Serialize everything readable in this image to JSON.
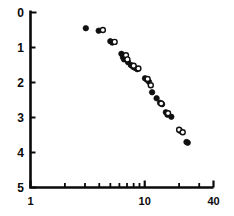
{
  "chart_data": {
    "type": "scatter",
    "title": "",
    "subtitle": "",
    "xlabel": "",
    "ylabel": "",
    "xscale": "log",
    "yscale": "linear",
    "xlim": [
      1,
      40
    ],
    "ylim": [
      5,
      0
    ],
    "y_inverted": true,
    "grid": false,
    "legend": "none",
    "x_tick_labels": [
      "1",
      "10",
      "40"
    ],
    "x_tick_values": [
      1,
      10,
      40
    ],
    "x_minor_ticks": [
      2,
      3,
      4,
      5,
      6,
      7,
      8,
      9,
      20,
      30
    ],
    "y_tick_labels": [
      "0",
      "1",
      "2",
      "3",
      "4",
      "5"
    ],
    "y_tick_values": [
      0,
      1,
      2,
      3,
      4,
      5
    ],
    "series": [
      {
        "name": "filled",
        "marker": "filled-circle",
        "color": "#101010",
        "points": [
          [
            3.05,
            0.45
          ],
          [
            3.95,
            0.52
          ],
          [
            5.0,
            0.82
          ],
          [
            5.2,
            0.86
          ],
          [
            6.25,
            1.18
          ],
          [
            6.45,
            1.28
          ],
          [
            6.6,
            1.34
          ],
          [
            7.15,
            1.42
          ],
          [
            7.55,
            1.5
          ],
          [
            7.9,
            1.55
          ],
          [
            8.2,
            1.58
          ],
          [
            8.6,
            1.62
          ],
          [
            10.05,
            1.88
          ],
          [
            10.45,
            1.92
          ],
          [
            10.9,
            1.98
          ],
          [
            11.6,
            2.28
          ],
          [
            12.7,
            2.45
          ],
          [
            13.6,
            2.58
          ],
          [
            14.2,
            2.62
          ],
          [
            15.3,
            2.85
          ],
          [
            15.8,
            2.92
          ],
          [
            17.1,
            2.98
          ],
          [
            20.4,
            3.38
          ],
          [
            23.2,
            3.7
          ],
          [
            23.8,
            3.72
          ]
        ]
      },
      {
        "name": "open",
        "marker": "open-circle",
        "color": "#101010",
        "points": [
          [
            4.3,
            0.5
          ],
          [
            5.45,
            0.84
          ],
          [
            6.85,
            1.22
          ],
          [
            7.05,
            1.34
          ],
          [
            8.0,
            1.52
          ],
          [
            8.8,
            1.6
          ],
          [
            10.6,
            1.9
          ],
          [
            11.3,
            2.08
          ],
          [
            13.95,
            2.6
          ],
          [
            16.0,
            2.88
          ],
          [
            20.0,
            3.35
          ],
          [
            21.5,
            3.42
          ]
        ]
      }
    ]
  },
  "axes": {
    "x_axis_name": "x-axis-log-1-to-40",
    "y_axis_name": "y-axis-0-to-5-inverted"
  }
}
